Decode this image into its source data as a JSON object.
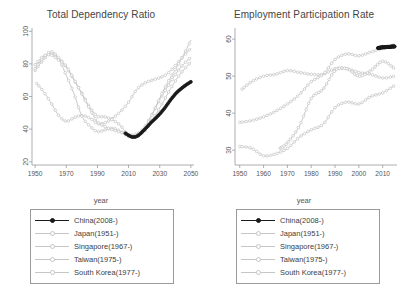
{
  "figure": {
    "xlabel": "year",
    "series_names": [
      "China(2008-)",
      "Japan(1951-)",
      "Singapore(1967-)",
      "Taiwan(1975-)",
      "South Korea(1977-)"
    ],
    "colors": {
      "primary": "#1a1a1a",
      "secondary": "#c6c6c6",
      "axis": "#9a9a9a",
      "text": "#4a4a4a"
    }
  },
  "legend": {
    "entries": [
      {
        "label": "China(2008-)"
      },
      {
        "label": "Japan(1951-)"
      },
      {
        "label": "Singapore(1967-)"
      },
      {
        "label": "Taiwan(1975-)"
      },
      {
        "label": "South Korea(1977-)"
      }
    ]
  },
  "chart_data": [
    {
      "type": "line",
      "title": "Total Dependency Ratio",
      "xlabel": "year",
      "ylabel": "",
      "xlim": [
        1948,
        2052
      ],
      "ylim": [
        18,
        102
      ],
      "xticks": [
        1950,
        1970,
        1990,
        2010,
        2030,
        2050
      ],
      "yticks": [
        20,
        40,
        60,
        80,
        100
      ],
      "grid": false,
      "legend_position": "below",
      "series": [
        {
          "name": "China(2008-)",
          "color": "#1a1a1a",
          "x": [
            2008,
            2010,
            2012,
            2014,
            2016,
            2018,
            2020,
            2022,
            2024,
            2026,
            2028,
            2030,
            2032,
            2034,
            2036,
            2038,
            2040,
            2042,
            2044,
            2046,
            2048,
            2050
          ],
          "values": [
            37.5,
            36.2,
            35.3,
            35.2,
            36.0,
            37.6,
            39.5,
            41.5,
            43.6,
            45.5,
            47.3,
            49.3,
            51.5,
            54.0,
            56.7,
            59.2,
            61.5,
            63.4,
            65.0,
            66.5,
            67.8,
            69.0
          ]
        },
        {
          "name": "Japan(1951-)",
          "color": "#c6c6c6",
          "x": [
            1951,
            1955,
            1960,
            1965,
            1970,
            1975,
            1980,
            1985,
            1990,
            1995,
            2000,
            2005,
            2010,
            2015,
            2020,
            2025,
            2030,
            2035,
            2040,
            2045,
            2050
          ],
          "values": [
            68.0,
            63.5,
            56.5,
            48.5,
            44.8,
            47.0,
            48.4,
            46.8,
            43.5,
            43.9,
            46.9,
            51.0,
            56.5,
            64.0,
            68.0,
            70.0,
            71.5,
            74.0,
            79.0,
            84.5,
            89.5
          ]
        },
        {
          "name": "Singapore(1967-)",
          "color": "#c6c6c6",
          "x": [
            1950,
            1955,
            1960,
            1965,
            1970,
            1975,
            1980,
            1985,
            1990,
            1995,
            2000,
            2005,
            2010,
            2015,
            2020,
            2025,
            2030,
            2035,
            2040,
            2045,
            2050
          ],
          "values": [
            76.0,
            82.0,
            86.5,
            83.0,
            73.0,
            61.5,
            48.0,
            42.0,
            38.5,
            39.5,
            40.5,
            38.5,
            35.5,
            36.5,
            41.0,
            49.0,
            58.0,
            66.0,
            73.5,
            79.5,
            84.0
          ]
        },
        {
          "name": "Taiwan(1975-)",
          "color": "#c6c6c6",
          "x": [
            1950,
            1955,
            1960,
            1965,
            1970,
            1975,
            1980,
            1985,
            1990,
            1995,
            2000,
            2005,
            2010,
            2015,
            2020,
            2025,
            2030,
            2035,
            2040,
            2045,
            2050
          ],
          "values": [
            77.0,
            83.5,
            87.5,
            84.0,
            78.0,
            70.0,
            62.0,
            53.5,
            48.0,
            47.5,
            45.5,
            42.0,
            36.0,
            35.5,
            38.5,
            45.0,
            53.0,
            61.5,
            69.5,
            76.0,
            81.0
          ]
        },
        {
          "name": "South Korea(1977-)",
          "color": "#c6c6c6",
          "x": [
            1950,
            1955,
            1960,
            1965,
            1970,
            1975,
            1980,
            1985,
            1990,
            1995,
            2000,
            2005,
            2010,
            2015,
            2020,
            2025,
            2030,
            2035,
            2040,
            2045,
            2050
          ],
          "values": [
            79.5,
            84.5,
            85.5,
            82.5,
            78.5,
            70.5,
            61.5,
            52.5,
            44.5,
            41.5,
            39.5,
            38.0,
            36.5,
            37.0,
            40.0,
            48.5,
            59.0,
            68.5,
            76.5,
            85.0,
            94.5
          ]
        }
      ]
    },
    {
      "type": "line",
      "title": "Employment Participation Rate",
      "xlabel": "year",
      "ylabel": "",
      "xlim": [
        1948,
        2016
      ],
      "ylim": [
        26,
        63
      ],
      "xticks": [
        1950,
        1960,
        1970,
        1980,
        1990,
        2000,
        2010
      ],
      "yticks": [
        30,
        40,
        50,
        60
      ],
      "grid": false,
      "legend_position": "below",
      "series": [
        {
          "name": "China(2008-)",
          "color": "#1a1a1a",
          "x": [
            2008,
            2009,
            2010,
            2011,
            2012,
            2013,
            2014,
            2015
          ],
          "values": [
            57.6,
            57.7,
            57.8,
            57.8,
            57.9,
            57.9,
            58.0,
            58.0
          ]
        },
        {
          "name": "Japan(1951-)",
          "color": "#c6c6c6",
          "x": [
            1951,
            1955,
            1960,
            1965,
            1970,
            1975,
            1980,
            1985,
            1990,
            1995,
            2000,
            2005,
            2010,
            2015
          ],
          "values": [
            46.5,
            48.5,
            50.0,
            50.5,
            51.5,
            51.0,
            50.5,
            50.5,
            52.0,
            52.0,
            51.0,
            50.5,
            49.5,
            50.0
          ]
        },
        {
          "name": "Singapore(1967-)",
          "color": "#c6c6c6",
          "x": [
            1967,
            1970,
            1975,
            1980,
            1985,
            1990,
            1995,
            2000,
            2005,
            2010,
            2015
          ],
          "values": [
            30.5,
            32.0,
            36.5,
            44.0,
            46.5,
            51.5,
            52.0,
            50.0,
            51.5,
            54.0,
            52.0
          ]
        },
        {
          "name": "Taiwan(1975-)",
          "color": "#c6c6c6",
          "x": [
            1950,
            1955,
            1960,
            1965,
            1970,
            1975,
            1980,
            1985,
            1990,
            1995,
            2000,
            2005,
            2010,
            2015
          ],
          "values": [
            37.5,
            38.0,
            39.0,
            40.5,
            42.5,
            45.0,
            48.5,
            50.5,
            54.5,
            56.0,
            55.5,
            56.5,
            57.5,
            58.5
          ]
        },
        {
          "name": "South Korea(1977-)",
          "color": "#c6c6c6",
          "x": [
            1950,
            1955,
            1960,
            1965,
            1970,
            1975,
            1980,
            1985,
            1990,
            1995,
            2000,
            2005,
            2010,
            2015
          ],
          "values": [
            31.0,
            30.5,
            28.5,
            29.0,
            30.5,
            33.5,
            35.5,
            37.0,
            41.5,
            43.0,
            42.5,
            44.5,
            45.5,
            47.5
          ]
        }
      ]
    }
  ]
}
